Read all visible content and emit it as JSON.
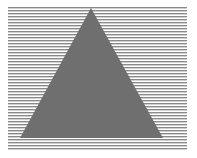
{
  "figure": {
    "colors": {
      "background": "#ffffff",
      "lines": "#8a8a8a",
      "triangle": "#6f6f6f"
    },
    "grating": {
      "x_start": 8,
      "x_end": 187,
      "y_start": 7,
      "y_end": 148,
      "spacing": 3,
      "thickness": 1.4
    },
    "triangle": {
      "apex": [
        91,
        8
      ],
      "base_left": [
        20,
        138
      ],
      "base_right": [
        163,
        138
      ]
    }
  }
}
